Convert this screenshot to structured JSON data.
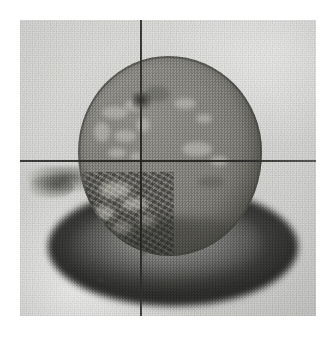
{
  "image": {
    "kind": "photograph",
    "subject": "round disc-shaped specimen resting on a dark elliptical base",
    "color_mode": "grayscale",
    "caption": "",
    "width_px": 334,
    "height_px": 338
  },
  "canvas": {
    "background_color": "#ffffff",
    "margin_px": 20
  },
  "photo": {
    "x": 20,
    "y": 20,
    "width": 296,
    "height": 296,
    "background_color": "#dbdbd9",
    "grain": "heavy film grain"
  },
  "overlay_lines": {
    "vertical": {
      "label": "vertical reference line",
      "x_px": 140,
      "color": "#2a2a28",
      "thickness_px": 2,
      "spans_full_height": true
    },
    "horizontal": {
      "label": "horizontal reference line",
      "y_px": 160,
      "color": "#2a2a28",
      "thickness_px": 2,
      "spans_full_width": true
    }
  },
  "specimen": {
    "label": "disc specimen",
    "shape": "irregular circle",
    "face_color": "#8a8984",
    "rim_color": "#46463f",
    "bounds": {
      "x": 78,
      "y": 56,
      "width": 184,
      "height": 200
    },
    "features": [
      {
        "name": "light-mottled-markings",
        "region": "upper-left face"
      },
      {
        "name": "rough-fractured-quadrant",
        "region": "lower-left face"
      },
      {
        "name": "top-notch",
        "region": "top center, where vertical line meets edge"
      }
    ]
  },
  "base": {
    "label": "dark elliptical base shadow",
    "color": "#37372f",
    "bounds": {
      "x": 48,
      "y": 188,
      "width": 250,
      "height": 118
    }
  },
  "fragment": {
    "label": "small dark fragment at left edge",
    "x": 18,
    "y": 166
  },
  "palette": {
    "paper": "#dcdcda",
    "specimen_face": "#8a8984",
    "specimen_shadow": "#6d6c66",
    "base_dark": "#37372f",
    "line": "#2a2a28",
    "highlight": "#d2d0c7"
  }
}
